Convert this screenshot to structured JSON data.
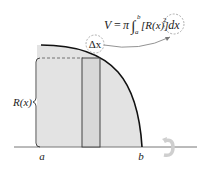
{
  "diagram": {
    "formula": {
      "lhs": "V",
      "equals": "=",
      "pi": "π",
      "integral": "∫",
      "upper_limit": "b",
      "lower_limit": "a",
      "integrand": "[R(x)]",
      "exponent": "2",
      "differential": "dx"
    },
    "labels": {
      "radius": "R(x)",
      "slice_width": "Δx",
      "left_bound": "a",
      "right_bound": "b"
    },
    "icons": {
      "rotation": "rotation-arrow-icon"
    },
    "colors": {
      "region_fill": "#e3e3e3",
      "curve_stroke": "#111111",
      "axis_stroke": "#666666",
      "dashed_circle": "#999999",
      "rotation_icon": "#cfcfcf"
    }
  }
}
